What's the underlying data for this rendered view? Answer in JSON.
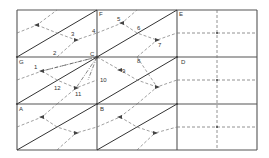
{
  "figure": {
    "colors": {
      "line": "#555555",
      "diagonal": "#333333",
      "dashed": "#777777",
      "background": "#ffffff"
    }
  },
  "corner_labels": {
    "F": "F",
    "E": "E",
    "G": "G",
    "C": "C",
    "D": "D",
    "A": "A",
    "B": "B"
  },
  "point_labels": [
    "1",
    "2",
    "3",
    "4",
    "5",
    "6",
    "7",
    "8",
    "9",
    "10",
    "11",
    "12"
  ]
}
